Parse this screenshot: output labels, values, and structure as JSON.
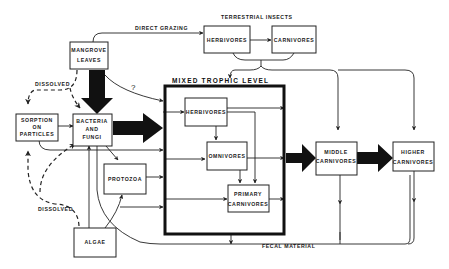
{
  "diagram": {
    "type": "food-web flow diagram",
    "background": "#ffffff",
    "ink": "#111111",
    "groups": {
      "terrestrial_insects": "TERRESTRIAL INSECTS",
      "mixed_trophic_level": "MIXED TROPHIC LEVEL"
    },
    "nodes": {
      "mangrove": {
        "line1": "MANGROVE",
        "line2": "LEAVES"
      },
      "sorption": {
        "line1": "SORPTION",
        "line2": "ON",
        "line3": "PARTICLES"
      },
      "bacteria": {
        "line1": "BACTERIA",
        "line2": "AND",
        "line3": "FUNGI"
      },
      "protozoa": {
        "line1": "PROTOZOA"
      },
      "algae": {
        "line1": "ALGAE"
      },
      "terr_herbivores": {
        "line1": "HERBIVORES"
      },
      "terr_carnivores": {
        "line1": "CARNIVORES"
      },
      "herbivores": {
        "line1": "HERBIVORES"
      },
      "omnivores": {
        "line1": "OMNIVORES"
      },
      "primary_carnivores": {
        "line1": "PRIMARY",
        "line2": "CARNIVORES"
      },
      "middle_carnivores": {
        "line1": "MIDDLE",
        "line2": "CARNIVORES"
      },
      "higher_carnivores": {
        "line1": "HIGHER",
        "line2": "CARNIVORES"
      }
    },
    "edge_labels": {
      "direct_grazing": "DIRECT GRAZING",
      "dissolved_top": "DISSOLVED",
      "dissolved_bottom": "DISSOLVED",
      "fecal_material": "FECAL MATERIAL",
      "uncertain": "?"
    },
    "edges": [
      {
        "from": "mangrove",
        "to": "terr_herbivores",
        "label": "DIRECT GRAZING",
        "style": "thin"
      },
      {
        "from": "mangrove",
        "to": "bacteria",
        "style": "thick"
      },
      {
        "from": "mangrove",
        "to": "mixed_trophic_level",
        "label": "?",
        "style": "thin"
      },
      {
        "from": "mangrove",
        "to": "sorption",
        "label": "DISSOLVED",
        "style": "dashed"
      },
      {
        "from": "mangrove",
        "to": "bacteria",
        "label": "DISSOLVED",
        "style": "dashed"
      },
      {
        "from": "sorption",
        "to": "bacteria",
        "style": "thin"
      },
      {
        "from": "sorption",
        "to": "mixed_trophic_level",
        "style": "thin"
      },
      {
        "from": "bacteria",
        "to": "mixed_trophic_level",
        "style": "thick"
      },
      {
        "from": "bacteria",
        "to": "protozoa",
        "style": "thin"
      },
      {
        "from": "protozoa",
        "to": "mixed_trophic_level",
        "style": "thin"
      },
      {
        "from": "algae",
        "to": "bacteria",
        "style": "thin"
      },
      {
        "from": "algae",
        "to": "protozoa",
        "style": "thin"
      },
      {
        "from": "algae",
        "to": "mixed_trophic_level",
        "style": "thin"
      },
      {
        "from": "algae",
        "to": "sorption",
        "label": "DISSOLVED",
        "style": "dashed"
      },
      {
        "from": "algae",
        "to": "bacteria",
        "style": "dashed"
      },
      {
        "from": "terr_herbivores",
        "to": "terr_carnivores",
        "style": "thin"
      },
      {
        "from": "terrestrial_insects",
        "to": "mixed_trophic_level",
        "style": "thin"
      },
      {
        "from": "terrestrial_insects",
        "to": "middle_carnivores",
        "style": "thin"
      },
      {
        "from": "terrestrial_insects",
        "to": "higher_carnivores",
        "style": "thin"
      },
      {
        "from": "herbivores",
        "to": "omnivores",
        "style": "thin"
      },
      {
        "from": "herbivores",
        "to": "primary_carnivores",
        "style": "thin"
      },
      {
        "from": "omnivores",
        "to": "primary_carnivores",
        "style": "thin"
      },
      {
        "from": "mixed_trophic_level",
        "to": "middle_carnivores",
        "style": "thick"
      },
      {
        "from": "middle_carnivores",
        "to": "higher_carnivores",
        "style": "thick"
      },
      {
        "from": "mixed_trophic_level",
        "to": "bacteria",
        "label": "FECAL MATERIAL",
        "style": "thin"
      },
      {
        "from": "middle_carnivores",
        "to": "bacteria",
        "label": "FECAL MATERIAL",
        "style": "thin"
      },
      {
        "from": "higher_carnivores",
        "to": "bacteria",
        "label": "FECAL MATERIAL",
        "style": "thin"
      }
    ]
  }
}
